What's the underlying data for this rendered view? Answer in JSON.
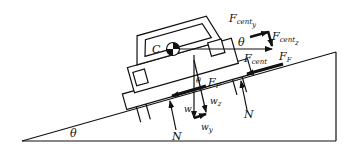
{
  "diagram": {
    "colors": {
      "ink": "#111111",
      "background": "#ffffff"
    },
    "incline": {
      "angle_label": "θ",
      "vertices": [
        [
          22,
          141
        ],
        [
          336,
          52
        ],
        [
          336,
          141
        ]
      ]
    },
    "center_of_mass": {
      "label": "C"
    },
    "labels": {
      "fcent_y_main": "F",
      "fcent_y_sub": "cent",
      "fcent_y_sub2": "y",
      "fcent_z_main": "F",
      "fcent_z_sub": "cent",
      "fcent_z_sub2": "z",
      "fcent_main": "F",
      "fcent_sub": "cent",
      "ff_right_main": "F",
      "ff_right_sub": "F",
      "ff_left_main": "F",
      "ff_left_sub": "F",
      "theta_top": "θ",
      "theta_mid": "θ",
      "theta_base": "θ",
      "n_left": "N",
      "n_right": "N",
      "n_mid": "N",
      "w": "w",
      "wz_main": "w",
      "wz_sub": "z",
      "wy_main": "w",
      "wy_sub": "y"
    }
  }
}
